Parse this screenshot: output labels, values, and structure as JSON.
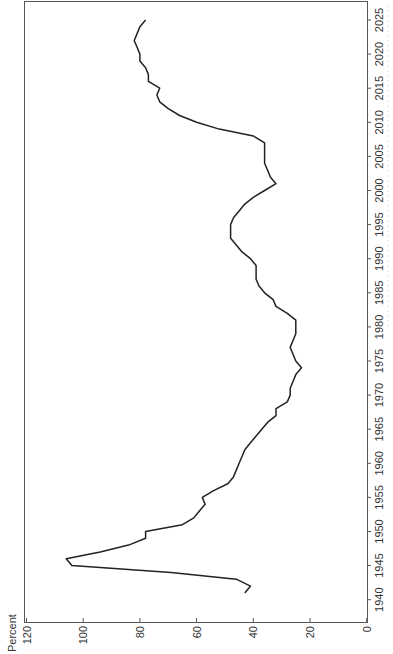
{
  "chart_data": {
    "type": "line",
    "orientation": "rotated-90-ccw",
    "title": "",
    "xlabel": "",
    "ylabel": "Percent",
    "xlim": [
      1938,
      2028
    ],
    "ylim": [
      0,
      120
    ],
    "x_ticks": [
      1940,
      1945,
      1950,
      1955,
      1960,
      1965,
      1970,
      1975,
      1980,
      1985,
      1990,
      1995,
      2000,
      2005,
      2010,
      2015,
      2020,
      2025
    ],
    "y_ticks": [
      0,
      20,
      40,
      60,
      80,
      100,
      120
    ],
    "grid": false,
    "legend": null,
    "series": [
      {
        "name": "Percent",
        "x": [
          1941,
          1942,
          1943,
          1944,
          1945,
          1946,
          1947,
          1948,
          1949,
          1950,
          1951,
          1952,
          1953,
          1954,
          1955,
          1956,
          1957,
          1958,
          1959,
          1960,
          1961,
          1962,
          1963,
          1964,
          1965,
          1966,
          1967,
          1968,
          1969,
          1970,
          1971,
          1972,
          1973,
          1974,
          1975,
          1976,
          1977,
          1978,
          1979,
          1980,
          1981,
          1982,
          1983,
          1984,
          1985,
          1986,
          1987,
          1988,
          1989,
          1990,
          1991,
          1992,
          1993,
          1994,
          1995,
          1996,
          1997,
          1998,
          1999,
          2000,
          2001,
          2002,
          2003,
          2004,
          2005,
          2006,
          2007,
          2008,
          2009,
          2010,
          2011,
          2012,
          2013,
          2014,
          2015,
          2016,
          2017,
          2018,
          2019,
          2020,
          2021,
          2022,
          2023,
          2024,
          2025
        ],
        "values": [
          43,
          41,
          46,
          69,
          104,
          106,
          94,
          84,
          78,
          78,
          65,
          61,
          59,
          57,
          58,
          54,
          49,
          47,
          46,
          45,
          44,
          43,
          41,
          39,
          37,
          35,
          32,
          32,
          28,
          27,
          27,
          26,
          25,
          23,
          25,
          26,
          27,
          26,
          25,
          25,
          25,
          28,
          32,
          33,
          36,
          38,
          39,
          39,
          39,
          41,
          44,
          46,
          48,
          48,
          48,
          47,
          45,
          43,
          40,
          36,
          32,
          34,
          35,
          36,
          36,
          36,
          36,
          40,
          52,
          60,
          66,
          70,
          73,
          74,
          73,
          77,
          77,
          78,
          80,
          80,
          81,
          82,
          81,
          80,
          78
        ]
      }
    ]
  },
  "labels": {
    "y_axis_title": "Percent"
  }
}
